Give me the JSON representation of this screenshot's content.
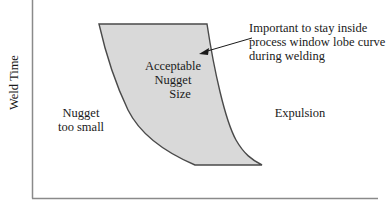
{
  "diagram": {
    "type": "process-window-lobe",
    "y_axis_label": "Weld Time",
    "x_axis_label": "",
    "regions": {
      "inside": [
        "Acceptable",
        "Nugget",
        "Size"
      ],
      "left": [
        "Nugget",
        "too small"
      ],
      "right": [
        "Expulsion"
      ]
    },
    "annotation": [
      "Important to stay inside",
      "process window lobe curve",
      "during welding"
    ],
    "colors": {
      "lobe_fill": "#d9d9d9",
      "lobe_stroke": "#4a4a4a",
      "axis": "#8a8a8a",
      "text": "#1a1a1a"
    }
  }
}
